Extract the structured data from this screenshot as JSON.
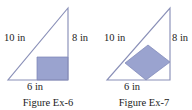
{
  "sheet": {
    "title": "Figure Ex-6 and Figure Ex-7",
    "background_color": "#ffffff"
  },
  "style": {
    "stroke_color": "#8a90b8",
    "shade_fill_color": "#9aa3cf",
    "shade_stroke_color": "#7a82b5",
    "text_color": "#1b1b1b"
  },
  "figures": [
    {
      "id": "ex6",
      "caption": "Figure Ex-6",
      "shape": "right-triangle",
      "inscribed_shape": "rectangle-corner",
      "labels": {
        "hypotenuse": "10 in",
        "vertical": "8 in",
        "base": "6 in"
      }
    },
    {
      "id": "ex7",
      "caption": "Figure Ex-7",
      "shape": "right-triangle",
      "inscribed_shape": "rotated-square",
      "labels": {
        "hypotenuse": "10 in",
        "vertical": "8 in",
        "base": "6 in"
      }
    }
  ]
}
